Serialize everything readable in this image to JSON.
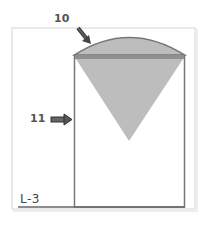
{
  "diagram": {
    "title": "",
    "labels": {
      "dome_callout": "10",
      "body_callout": "11",
      "level": "L-3"
    },
    "colors": {
      "frame": "#d6d6d6",
      "frame_shadow": "#eeeeee",
      "outline": "#777777",
      "fill": "#bdbdbd",
      "band": "#8f8f8f",
      "arrow_fill": "#555555",
      "arrow_stroke": "#333333",
      "text": "#555555"
    },
    "components": [
      {
        "id": "10",
        "name": "dome-roof",
        "shape": "arc"
      },
      {
        "id": "11",
        "name": "silo-wall",
        "shape": "rectangle"
      },
      {
        "id": "hopper",
        "name": "inverted-cone",
        "shape": "triangle"
      }
    ]
  }
}
